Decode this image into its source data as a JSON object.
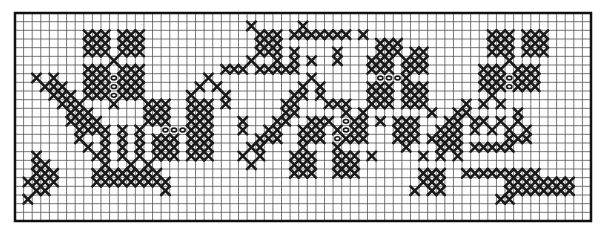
{
  "grid": {
    "cols": 67,
    "rows": 24
  },
  "colors": {
    "stitch": "#1a1a1a",
    "grid": "#555555",
    "border": "#111111",
    "background": "#ffffff"
  },
  "legend": {
    "X": "cross stitch",
    "o": "bead / french knot",
    ".": "empty"
  },
  "pattern": [
    "...................................................................",
    "...........................X.....X.................................",
    "........XXX.XXX.............XXX.XXXXXXX.X..............XXX.XXX.....",
    "........XXX.XXX.............XXX...........XXX..........XXX.XXX.....",
    "........XXX.XXX.............XXX.X....X....XXX.XX.......XXX.XXX.....",
    "...........X...............X..X.X.X..X...XXX.XXX.........X.........",
    "........XXX.XXX.........XXX.XXXXX........XXX.XXX......XXX.XXX.....",
    "..X.X...XXXoXXX.......X...........X.......oooX........XXXoXXX.....",
    "...XXX..XXXoXXX......X.X.........X.X.....XXX.XXX......XXXoXXX.....",
    "....XXX.XXXoXXX.....X...X.......XX.X.....XXX.XXX.......X..........",
    ".....XXX...X...XXX..XXX.X......XX...XXX..XXX.XXX....X.X.X.........",
    "......XXX......XXX..XXX........XX.....X.X.......X..XX.....X.......",
    "......XXXX.....XXX..XXX...X...XX..XXX.oXX.X.XXX...XX.XX.X.X.......",
    ".......XXXX.X.X..oooXXX...X..XX..XXX.XoXX...XXX..XXX.X.X.X.X......",
    ".......X..X.X.X.XXX.XXX.....XXX..XXX.oXXX...XXX.XXXX.....XXX......",
    "........X.X.X.X.XXX.XXX....XX....X...X.......X...XXX.XXXXX........",
    "..X......XX.X.X.XXX.XXX...X.X...XXX..XXX.X.....X.X.X..............",
    "..XX......X..X.X...........X....XXX..XXX..........................",
    "..XXX....XXXXXXXX...............XXX..XXX.......XXX..XXXXXXXXX.....",
    ".XXXX....XXXXXXXXX.............................XXX.......XXXXXXXX..",
    "..XX.............X............................X.XX.......XXXXXXXX..",
    ".X......................................................XX.........",
    "...................................................................",
    "..................................................................."
  ]
}
